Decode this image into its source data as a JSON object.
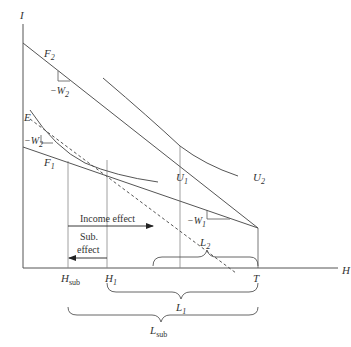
{
  "axes": {
    "y_label": "I",
    "x_label": "H",
    "t_label": "T"
  },
  "lines": {
    "f2": "F",
    "f2_sub": "2",
    "f1": "F",
    "f1_sub": "1",
    "e_label": "E",
    "u1": "U",
    "u1_sub": "1",
    "u2": "U",
    "u2_sub": "2"
  },
  "slopes": {
    "w2_top": "−W",
    "w2_top_sub": "2",
    "w2_left": "−W",
    "w2_left_sub": "2",
    "w1": "−W",
    "w1_sub": "1"
  },
  "effects": {
    "income": "Income effect",
    "sub_line1": "Sub.",
    "sub_line2": "effect"
  },
  "ticks": {
    "h_sub": "H",
    "h_sub_sub": "sub",
    "h1": "H",
    "h1_sub": "1"
  },
  "braces": {
    "l2": "L",
    "l2_sub": "2",
    "l1": "L",
    "l1_sub": "1",
    "l_sub": "L",
    "l_sub_sub": "sub"
  },
  "colors": {
    "line": "#555555",
    "text": "#333333",
    "background": "#ffffff"
  }
}
